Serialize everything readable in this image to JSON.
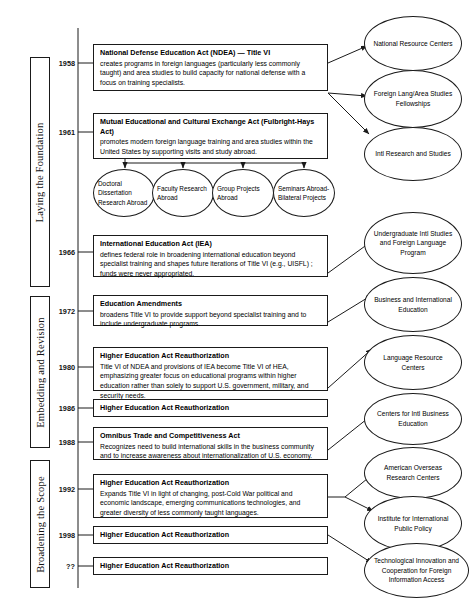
{
  "diagram": {
    "eras": [
      {
        "id": "era-laying",
        "label": "Laying the Foundation"
      },
      {
        "id": "era-embedding",
        "label": "Embedding and Revision"
      },
      {
        "id": "era-broadening",
        "label": "Broadening the Scope"
      }
    ],
    "events": [
      {
        "id": "ndea-1958",
        "year": "1958",
        "title": "National Defense Education Act (NDEA)  — Title VI",
        "desc": "creates programs in foreign languages (particularly less commonly taught) and area studies to build capacity for national defense with a focus on training specialists."
      },
      {
        "id": "fulbright-1961",
        "year": "1961",
        "title": "Mutual Educational and Cultural Exchange Act (Fulbright-Hays Act)",
        "desc": "promotes modern foreign language training and area studies within the United States by supporting visits and study abroad."
      },
      {
        "id": "iea-1966",
        "year": "1966",
        "title": "International Education Act (IEA)",
        "desc": "defines federal role in broadening international education beyond specialist training and shapes future iterations of Title VI (e.g., UISFL) ; funds were never appropriated."
      },
      {
        "id": "edamend-1972",
        "year": "1972",
        "title": "Education Amendments",
        "desc": "broadens Title VI to provide support beyond specialist training and to include undergraduate programs."
      },
      {
        "id": "hea-1980",
        "year": "1980",
        "title": "Higher Education Act Reauthorization",
        "desc": "Title VI of NDEA and provisions of IEA become Title VI of HEA, emphasizing greater focus on educational programs within higher education rather than solely to support U.S. government, military, and security needs."
      },
      {
        "id": "hea-1986",
        "year": "1986",
        "title": "Higher Education Act Reauthorization",
        "desc": ""
      },
      {
        "id": "omnibus-1988",
        "year": "1988",
        "title": "Omnibus Trade and Competitiveness Act",
        "desc": "Recognizes need to build international skills in the business community and to increase awareness about internationalization of U.S. economy."
      },
      {
        "id": "hea-1992",
        "year": "1992",
        "title": "Higher Education Act Reauthorization",
        "desc": "Expands Title VI in light of changing, post-Cold War political and economic landscape, emerging communications technologies, and greater diversity of less commonly taught languages."
      },
      {
        "id": "hea-1998",
        "year": "1998",
        "title": "Higher Education Act Reauthorization",
        "desc": ""
      },
      {
        "id": "hea-unknown",
        "year": "??",
        "title": "Higher Education Act Reauthorization",
        "desc": ""
      }
    ],
    "program_ovals": [
      {
        "id": "doctoral-dissertation",
        "label": "Doctoral Dissertation Research Abroad"
      },
      {
        "id": "faculty-research",
        "label": "Faculty Research Abroad"
      },
      {
        "id": "group-projects",
        "label": "Group Projects Abroad"
      },
      {
        "id": "seminars-abroad",
        "label": "Seminars Abroad-Bilateral Projects"
      }
    ],
    "outcome_ovals": [
      {
        "id": "national-resource-centers",
        "label": "National Resource Centers"
      },
      {
        "id": "flas-fellowships",
        "label": "Foreign Lang/Area Studies Fellowships"
      },
      {
        "id": "intl-research-studies",
        "label": "Intl Research and Studies"
      },
      {
        "id": "uisfl",
        "label": "Undergraduate Intl Studies and Foreign Language Program"
      },
      {
        "id": "business-intl-education",
        "label": "Business and International Education"
      },
      {
        "id": "language-resource-centers",
        "label": "Language Resource Centers"
      },
      {
        "id": "cibe",
        "label": "Centers for Intl Business Education"
      },
      {
        "id": "aorc",
        "label": "American Overseas Research Centers"
      },
      {
        "id": "iipp",
        "label": "Institute for International Public Policy"
      },
      {
        "id": "ticfia",
        "label": "Technological Innovation and Cooperation for Foreign Information Access"
      }
    ],
    "colors": {
      "stroke": "#1a1a1a",
      "background": "#ffffff",
      "text": "#000000"
    }
  }
}
